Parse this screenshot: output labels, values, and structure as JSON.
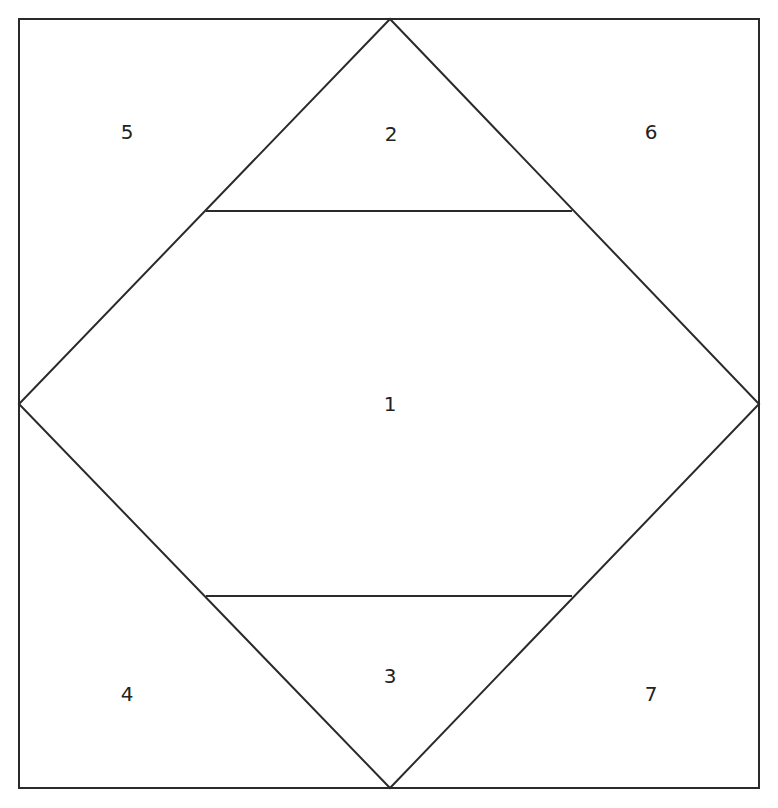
{
  "diagram": {
    "type": "paper-piecing-block",
    "stroke_color": "#2a2a2a",
    "background": "#ffffff",
    "frame": {
      "x1": 19,
      "y1": 19,
      "x2": 759,
      "y2": 788
    },
    "diamond": {
      "top": [
        390,
        19
      ],
      "right": [
        759,
        404
      ],
      "bottom": [
        390,
        788
      ],
      "left": [
        19,
        404
      ]
    },
    "cut_lines": [
      {
        "name": "upper-cut",
        "from": [
          206,
          211
        ],
        "to": [
          572,
          211
        ]
      },
      {
        "name": "lower-cut",
        "from": [
          206,
          596
        ],
        "to": [
          572,
          596
        ]
      }
    ],
    "pieces": [
      {
        "number": "1",
        "x": 390,
        "y": 404
      },
      {
        "number": "2",
        "x": 391,
        "y": 134
      },
      {
        "number": "3",
        "x": 390,
        "y": 676
      },
      {
        "number": "4",
        "x": 127,
        "y": 694
      },
      {
        "number": "5",
        "x": 127,
        "y": 132
      },
      {
        "number": "6",
        "x": 651,
        "y": 132
      },
      {
        "number": "7",
        "x": 651,
        "y": 694
      }
    ]
  }
}
